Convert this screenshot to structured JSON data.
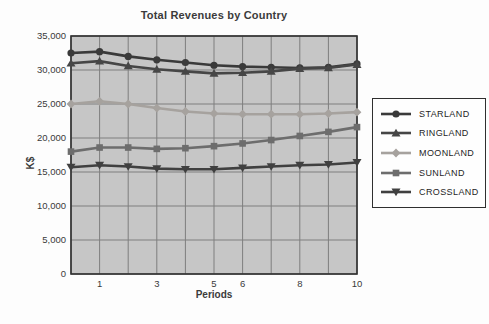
{
  "chart_data": {
    "type": "line",
    "title": "Total Revenues by Country",
    "xlabel": "Periods",
    "ylabel": "K$",
    "xlim": [
      0,
      10
    ],
    "ylim": [
      0,
      35000
    ],
    "grid": true,
    "legend_position": "right",
    "x": [
      0,
      1,
      2,
      3,
      4,
      5,
      6,
      7,
      8,
      9,
      10
    ],
    "x_ticks": [
      {
        "value": 1,
        "label": "1"
      },
      {
        "value": 3,
        "label": "3"
      },
      {
        "value": 5,
        "label": "5"
      },
      {
        "value": 6,
        "label": "6"
      },
      {
        "value": 8,
        "label": "8"
      },
      {
        "value": 10,
        "label": "10"
      }
    ],
    "y_ticks": [
      {
        "value": 0,
        "label": "0"
      },
      {
        "value": 5000,
        "label": "5,000"
      },
      {
        "value": 10000,
        "label": "10,000"
      },
      {
        "value": 15000,
        "label": "15,000"
      },
      {
        "value": 20000,
        "label": "20,000"
      },
      {
        "value": 25000,
        "label": "25,000"
      },
      {
        "value": 30000,
        "label": "30,000"
      },
      {
        "value": 35000,
        "label": "35,000"
      }
    ],
    "colors": {
      "plot_bg": "#c6c6c6",
      "grid": "#7e7e7e",
      "axis": "#2f2f2f",
      "text": "#3a3a3a",
      "page_bg": "#fdfdfd"
    },
    "series": [
      {
        "name": "STARLAND",
        "marker": "circle",
        "color": "#3a3a3a",
        "values": [
          32500,
          32700,
          32000,
          31500,
          31100,
          30700,
          30500,
          30400,
          30300,
          30400,
          30900
        ]
      },
      {
        "name": "RINGLAND",
        "marker": "triangle-up",
        "color": "#464646",
        "values": [
          31000,
          31300,
          30600,
          30100,
          29800,
          29500,
          29600,
          29800,
          30200,
          30300,
          30800
        ]
      },
      {
        "name": "MOONLAND",
        "marker": "diamond",
        "color": "#a6a29e",
        "values": [
          25000,
          25400,
          25000,
          24400,
          23900,
          23600,
          23500,
          23500,
          23500,
          23600,
          23800
        ]
      },
      {
        "name": "SUNLAND",
        "marker": "square",
        "color": "#6d6d6d",
        "values": [
          18000,
          18600,
          18600,
          18400,
          18500,
          18800,
          19200,
          19700,
          20300,
          20900,
          21600
        ]
      },
      {
        "name": "CROSSLAND",
        "marker": "triangle-down",
        "color": "#404040",
        "values": [
          15700,
          16000,
          15800,
          15500,
          15400,
          15400,
          15600,
          15800,
          16000,
          16100,
          16400
        ]
      }
    ]
  }
}
